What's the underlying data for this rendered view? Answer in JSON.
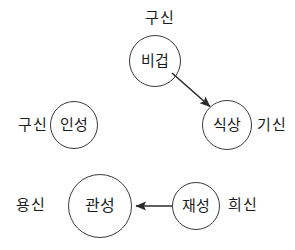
{
  "diagram": {
    "type": "node-arrow-diagram",
    "background_color": "#ffffff",
    "stroke_color": "#3a3a3a",
    "text_color": "#1c1c1c",
    "nodes": [
      {
        "id": "bigeop",
        "label": "비겁",
        "cx": 155,
        "cy": 61,
        "r": 26,
        "side_label": "구신",
        "side_label_position": "top"
      },
      {
        "id": "siksang",
        "label": "식상",
        "cx": 227,
        "cy": 125,
        "r": 25,
        "side_label": "기신",
        "side_label_position": "right"
      },
      {
        "id": "inseong",
        "label": "인성",
        "cx": 74,
        "cy": 125,
        "r": 24,
        "side_label": "구신",
        "side_label_position": "left"
      },
      {
        "id": "gwanseong",
        "label": "관성",
        "cx": 100,
        "cy": 206,
        "r": 32,
        "side_label": "용신",
        "side_label_position": "left"
      },
      {
        "id": "jaeseong",
        "label": "재성",
        "cx": 196,
        "cy": 206,
        "r": 24,
        "side_label": "희신",
        "side_label_position": "right"
      }
    ],
    "arrows": [
      {
        "id": "bigeop-to-siksang",
        "from": "비겁",
        "to": "식상",
        "x1": 172,
        "y1": 73,
        "x2": 212,
        "y2": 108
      },
      {
        "id": "jaeseong-to-gwanseong",
        "from": "재성",
        "to": "관성",
        "x1": 172,
        "y1": 206,
        "x2": 134,
        "y2": 206
      }
    ],
    "labels": {
      "top_gusin": "구신",
      "right_gisin": "기신",
      "left_gusin": "구신",
      "left_yongsin": "용신",
      "right_huisin": "희신"
    }
  }
}
